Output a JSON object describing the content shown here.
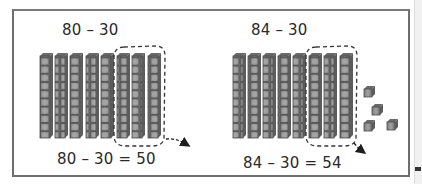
{
  "diagram": {
    "panels": [
      {
        "id": "left",
        "problem": "80 – 30",
        "equation": "80 – 30 = 50",
        "tens_rods": 8,
        "rods_removed": 3,
        "unit_cubes": 0,
        "result": 50
      },
      {
        "id": "right",
        "problem": "84 – 30",
        "equation": "84 – 30 = 54",
        "tens_rods": 8,
        "rods_removed": 3,
        "unit_cubes": 4,
        "result": 54
      }
    ],
    "colors": {
      "frame_border": "#6e6e6e",
      "rod_fill": "#8a8a8a",
      "rod_face": "#9c9c9c",
      "rod_edge": "#4a4a4a",
      "dashed_outline": "#333333",
      "text": "#2a2a2a"
    }
  }
}
